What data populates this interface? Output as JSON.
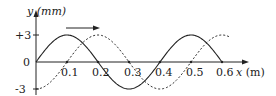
{
  "chart_data": {
    "type": "line",
    "title": "",
    "xlabel": "x",
    "xunit": "(m)",
    "ylabel": "y",
    "yunit": "(mm)",
    "xlim": [
      0,
      0.62
    ],
    "ylim": [
      -3,
      3
    ],
    "x_ticks": [
      "0.1",
      "0.2",
      "0.3",
      "0.4",
      "0.5",
      "0.6"
    ],
    "y_ticks": [
      "+3",
      "0",
      "-3"
    ],
    "grid": false,
    "legend": null,
    "annotations": [
      {
        "type": "arrow",
        "direction": "right",
        "meaning": "direction of wave propagation"
      }
    ],
    "series": [
      {
        "name": "solid wave (initial)",
        "style": "solid",
        "x": [
          0,
          0.1,
          0.2,
          0.3,
          0.4,
          0.5,
          0.6
        ],
        "values": [
          0,
          3,
          0,
          -3,
          0,
          3,
          0
        ]
      },
      {
        "name": "dashed wave (shifted)",
        "style": "dashed",
        "x": [
          0,
          0.1,
          0.2,
          0.3,
          0.4,
          0.5,
          0.6
        ],
        "values": [
          -3,
          0,
          3,
          0,
          -3,
          0,
          3
        ]
      }
    ]
  },
  "labels": {
    "y_axis": "y (mm)",
    "x_axis_var": "x",
    "x_axis_unit": "(m)",
    "y_plus3": "+3",
    "y_zero": "0",
    "y_minus3": "-3",
    "xt1": "0.1",
    "xt2": "0.2",
    "xt3": "0.3",
    "xt4": "0.4",
    "xt5": "0.5",
    "xt6": "0.6"
  }
}
